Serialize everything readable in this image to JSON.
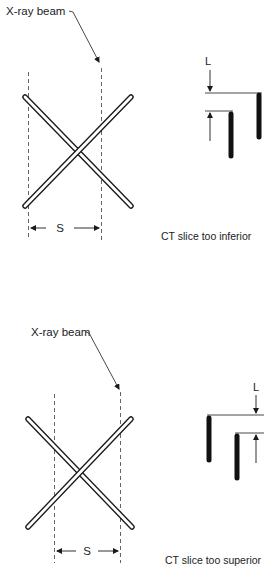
{
  "panels": [
    {
      "id": "inferior",
      "beam_label": "X-ray beam",
      "width_label": "S",
      "offset_label": "L",
      "caption": "CT slice too inferior"
    },
    {
      "id": "superior",
      "beam_label": "X-ray beam",
      "width_label": "S",
      "offset_label": "L",
      "caption": "CT slice too superior"
    }
  ],
  "colors": {
    "ink": "#1a1a1a",
    "dash": "#555555",
    "rod_fill": "#ffffff"
  }
}
